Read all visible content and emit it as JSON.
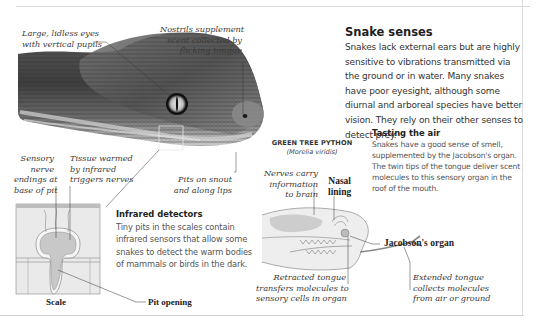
{
  "page": {
    "heading": "Snake senses",
    "intro": "Snakes lack external ears but are highly sensitive to vibrations transmitted via the ground or in water. Many snakes have poor eyesight, although some diurnal and arboreal species have better vision. They rely on their other senses to detect prey."
  },
  "photo_callouts": {
    "eyes": "Large, lidless eyes with vertical pupils",
    "eyes_lines": [
      "Large, lidless eyes",
      "with vertical pupils"
    ],
    "nostrils_lines": [
      "Nostrils supplement",
      "scent collected by",
      "flicking tongue"
    ],
    "pits_lines": [
      "Pits on snout",
      "and along lips"
    ]
  },
  "infrared": {
    "heading": "Infrared detectors",
    "body": "Tiny pits in the scales contain infrared sensors that allow some snakes to detect the warm bodies of mammals or birds in the dark.",
    "callout_nerve_lines": [
      "Sensory",
      "nerve",
      "endings at",
      "base of pit"
    ],
    "callout_tissue_lines": [
      "Tissue warmed",
      "by infrared",
      "triggers nerves"
    ],
    "label_scale": "Scale",
    "label_pit_opening": "Pit opening"
  },
  "tasting": {
    "heading": "Tasting the air",
    "body": "Snakes have a good sense of smell, supplemented by the Jacobson's organ. The twin tips of the tongue deliver scent molecules to this sensory organ in the roof of the mouth.",
    "species_name": "GREEN TREE PYTHON",
    "species_latin": "(Morelia viridis)",
    "callout_nerves_lines": [
      "Nerves carry",
      "information",
      "to brain"
    ],
    "label_nasal_lines": [
      "Nasal",
      "lining"
    ],
    "label_jacobson": "Jacobson's organ",
    "callout_retracted_lines": [
      "Retracted tongue",
      "transfers molecules to",
      "sensory cells in organ"
    ],
    "callout_extended_lines": [
      "Extended tongue",
      "collects molecules",
      "from air or ground"
    ]
  },
  "colors": {
    "text_dark": "#1e1e1e",
    "text_body": "#333333",
    "text_muted": "#555555",
    "diagram_fill": "#e6e6e6",
    "diagram_shade": "#c4c4c4",
    "rule": "#d8d8d8"
  }
}
